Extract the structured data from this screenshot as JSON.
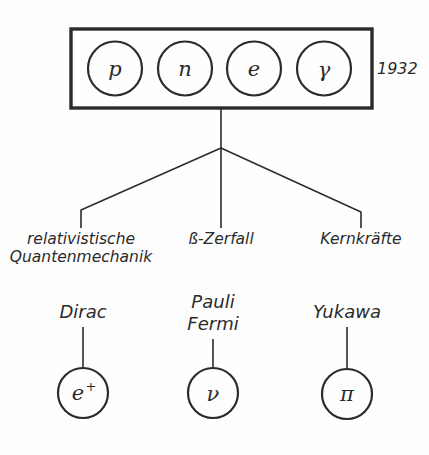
{
  "figure": {
    "ink_color": "#2b2b2b",
    "background_color": "#fefefe"
  },
  "year_box": {
    "year_label": "1932",
    "particles": [
      {
        "symbol": "p",
        "name": "proton"
      },
      {
        "symbol": "n",
        "name": "neutron"
      },
      {
        "symbol": "e",
        "name": "electron"
      },
      {
        "symbol": "γ",
        "name": "photon"
      }
    ]
  },
  "branches": [
    {
      "label_line1": "relativistische",
      "label_line2": "Quantenmechanik"
    },
    {
      "label_line1": "ß-Zerfall",
      "label_line2": ""
    },
    {
      "label_line1": "Kernkräfte",
      "label_line2": ""
    }
  ],
  "discoveries": [
    {
      "person_line1": "Dirac",
      "person_line2": "",
      "particle_symbol": "e",
      "particle_superscript": "+",
      "particle_name": "positron"
    },
    {
      "person_line1": "Pauli",
      "person_line2": "Fermi",
      "particle_symbol": "ν",
      "particle_superscript": "",
      "particle_name": "neutrino"
    },
    {
      "person_line1": "Yukawa",
      "person_line2": "",
      "particle_symbol": "π",
      "particle_superscript": "",
      "particle_name": "pion"
    }
  ]
}
